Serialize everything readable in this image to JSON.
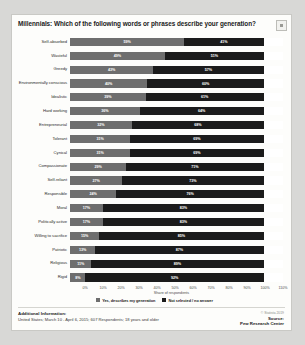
{
  "header": {
    "title": "Millennials: Which of the following words or phrases describe your generation?",
    "corner_button": "expand-button"
  },
  "footer": {
    "additional_label": "Additional Information:",
    "additional_text": "United States; March 10 - April 6, 2015; 607 Respondents; 18 years and older",
    "copyright": "© Statista 2019",
    "source_label": "Source:",
    "source_name": "Pew Research Center"
  },
  "colors": {
    "yes": "#6e6e6e",
    "no": "#1b1b1b",
    "page": "#fdfdfb",
    "background": "#d8d8d6"
  },
  "chart_data": {
    "type": "bar",
    "orientation": "horizontal",
    "stacked": true,
    "title": "Millennials: Which of the following words or phrases describe your generation?",
    "xlabel": "Share of respondents",
    "ylabel": "",
    "xlim": [
      0,
      110
    ],
    "grid": false,
    "legend_position": "bottom",
    "tick_labels": [
      "0%",
      "10%",
      "20%",
      "30%",
      "40%",
      "50%",
      "60%",
      "70%",
      "80%",
      "90%",
      "100%",
      "110%"
    ],
    "categories": [
      "Self-absorbed",
      "Wasteful",
      "Greedy",
      "Environmentally conscious",
      "Idealistic",
      "Hard working",
      "Entrepreneurial",
      "Tolerant",
      "Cynical",
      "Compassionate",
      "Self-reliant",
      "Responsible",
      "Moral",
      "Politically active",
      "Willing to sacrifice",
      "Patriotic",
      "Religious",
      "Rigid"
    ],
    "series": [
      {
        "name": "Yes, describes my generation",
        "values": [
          59,
          49,
          43,
          40,
          39,
          36,
          32,
          31,
          31,
          29,
          27,
          24,
          17,
          17,
          15,
          13,
          11,
          8
        ],
        "labels": [
          "59%",
          "49%",
          "43%",
          "40%",
          "39%",
          "36%",
          "32%",
          "31%",
          "31%",
          "29%",
          "27%",
          "24%",
          "17%",
          "17%",
          "15%",
          "13%",
          "11%",
          "8%"
        ]
      },
      {
        "name": "Not selected / no answer",
        "values": [
          41,
          51,
          57,
          60,
          61,
          64,
          68,
          69,
          69,
          71,
          73,
          76,
          83,
          83,
          85,
          87,
          89,
          92
        ],
        "labels": [
          "41%",
          "51%",
          "57%",
          "60%",
          "61%",
          "64%",
          "68%",
          "69%",
          "69%",
          "71%",
          "73%",
          "76%",
          "83%",
          "83%",
          "85%",
          "87%",
          "89%",
          "92%"
        ]
      }
    ]
  }
}
